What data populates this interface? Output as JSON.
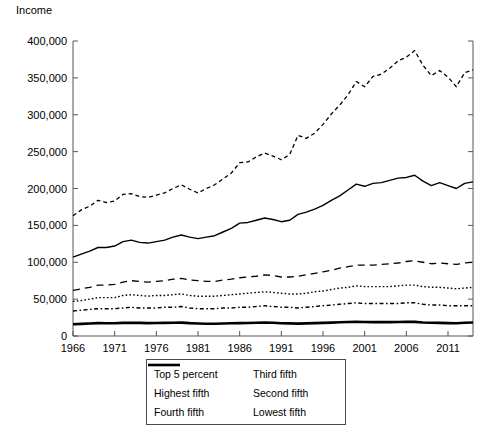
{
  "chart_data": {
    "type": "line",
    "title": "",
    "xlabel": "",
    "ylabel": "Income",
    "ylim": [
      0,
      400000
    ],
    "xlim": [
      1966,
      2014
    ],
    "grid": false,
    "legend_position": "bottom-center",
    "ytick_labels": [
      "0",
      "50,000",
      "100,000",
      "150,000",
      "200,000",
      "250,000",
      "300,000",
      "350,000",
      "400,000"
    ],
    "ytick_values": [
      0,
      50000,
      100000,
      150000,
      200000,
      250000,
      300000,
      350000,
      400000
    ],
    "xtick_labels": [
      "1966",
      "1971",
      "1976",
      "1981",
      "1986",
      "1991",
      "1996",
      "2001",
      "2006",
      "2011"
    ],
    "xtick_values": [
      1966,
      1971,
      1976,
      1981,
      1986,
      1991,
      1996,
      2001,
      2006,
      2011
    ],
    "x": [
      1966,
      1967,
      1968,
      1969,
      1970,
      1971,
      1972,
      1973,
      1974,
      1975,
      1976,
      1977,
      1978,
      1979,
      1980,
      1981,
      1982,
      1983,
      1984,
      1985,
      1986,
      1987,
      1988,
      1989,
      1990,
      1991,
      1992,
      1993,
      1994,
      1995,
      1996,
      1997,
      1998,
      1999,
      2000,
      2001,
      2002,
      2003,
      2004,
      2005,
      2006,
      2007,
      2008,
      2009,
      2010,
      2011,
      2012,
      2013,
      2014
    ],
    "series": [
      {
        "name": "Top 5 percent",
        "style": "dotted-dash",
        "color": "#000000",
        "values": [
          163000,
          171000,
          176000,
          184000,
          181000,
          183000,
          192000,
          193000,
          189000,
          188000,
          191000,
          194000,
          200000,
          205000,
          199000,
          194000,
          200000,
          205000,
          213000,
          221000,
          235000,
          236000,
          243000,
          248000,
          244000,
          239000,
          246000,
          272000,
          268000,
          275000,
          287000,
          301000,
          313000,
          327000,
          345000,
          338000,
          352000,
          355000,
          363000,
          373000,
          378000,
          387000,
          367000,
          353000,
          360000,
          351000,
          338000,
          357000,
          361000
        ]
      },
      {
        "name": "Highest fifth",
        "style": "solid",
        "color": "#000000",
        "values": [
          107000,
          111000,
          115000,
          120000,
          120000,
          122000,
          128000,
          130000,
          127000,
          126000,
          128000,
          130000,
          134000,
          137000,
          134000,
          132000,
          134000,
          136000,
          141000,
          146000,
          153000,
          154000,
          157000,
          160000,
          158000,
          155000,
          157000,
          165000,
          168000,
          172000,
          177000,
          184000,
          190000,
          198000,
          206000,
          203000,
          207000,
          208000,
          211000,
          214000,
          215000,
          218000,
          210000,
          204000,
          208000,
          204000,
          200000,
          207000,
          209000
        ]
      },
      {
        "name": "Fourth fifth",
        "style": "dashed",
        "color": "#000000",
        "values": [
          62000,
          64000,
          66000,
          69000,
          69000,
          70000,
          73000,
          75000,
          74000,
          73000,
          74000,
          75000,
          77000,
          78000,
          76000,
          75000,
          74000,
          74000,
          76000,
          77000,
          79000,
          80000,
          81000,
          83000,
          82000,
          80000,
          80000,
          81000,
          83000,
          85000,
          87000,
          89000,
          92000,
          94000,
          96000,
          96000,
          96000,
          97000,
          98000,
          99000,
          101000,
          102000,
          100000,
          98000,
          99000,
          98000,
          97000,
          99000,
          100000
        ]
      },
      {
        "name": "Third fifth",
        "style": "dotted",
        "color": "#000000",
        "values": [
          47000,
          48000,
          50000,
          52000,
          52000,
          52000,
          55000,
          56000,
          55000,
          54000,
          55000,
          55000,
          56000,
          57000,
          55000,
          54000,
          54000,
          54000,
          55000,
          56000,
          57000,
          58000,
          59000,
          60000,
          59000,
          58000,
          57000,
          57000,
          58000,
          60000,
          61000,
          63000,
          65000,
          66000,
          68000,
          67000,
          67000,
          67000,
          67000,
          68000,
          69000,
          69000,
          67000,
          66000,
          66000,
          65000,
          64000,
          65000,
          66000
        ]
      },
      {
        "name": "Second fifth",
        "style": "dash-dot",
        "color": "#000000",
        "values": [
          34000,
          35000,
          36000,
          37000,
          37000,
          37000,
          38000,
          39000,
          38000,
          38000,
          38000,
          39000,
          39000,
          40000,
          38000,
          37000,
          37000,
          37000,
          38000,
          38000,
          39000,
          39000,
          40000,
          41000,
          40000,
          39000,
          39000,
          38000,
          39000,
          40000,
          41000,
          42000,
          43000,
          44000,
          45000,
          44000,
          44000,
          44000,
          44000,
          44000,
          45000,
          45000,
          43000,
          42000,
          42000,
          41000,
          41000,
          41000,
          41000
        ]
      },
      {
        "name": "Lowest fifth",
        "style": "thick-solid",
        "color": "#000000",
        "values": [
          16000,
          16500,
          17000,
          17500,
          17300,
          17200,
          17800,
          18000,
          17800,
          17500,
          17700,
          17800,
          18000,
          18200,
          17400,
          17000,
          16700,
          16600,
          16900,
          17200,
          17500,
          17700,
          17900,
          18200,
          17900,
          17300,
          17100,
          16800,
          17100,
          17500,
          17800,
          18200,
          18700,
          19000,
          19300,
          19000,
          18800,
          18800,
          18800,
          18900,
          19100,
          19200,
          18400,
          17900,
          17800,
          17500,
          17300,
          18000,
          18300
        ]
      }
    ]
  },
  "legend": {
    "items": [
      {
        "label": "Top 5 percent",
        "style": "dotted-dash"
      },
      {
        "label": "Third fifth",
        "style": "dotted"
      },
      {
        "label": "Highest fifth",
        "style": "solid"
      },
      {
        "label": "Second fifth",
        "style": "dash-dot"
      },
      {
        "label": "Fourth fifth",
        "style": "dashed"
      },
      {
        "label": "Lowest fifth",
        "style": "thick-solid"
      }
    ]
  }
}
